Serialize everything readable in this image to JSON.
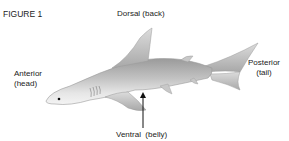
{
  "figure": {
    "title": "FIGURE 1",
    "labels": {
      "dorsal": "Dorsal (back)",
      "anterior_line1": "Anterior",
      "anterior_line2": "(head)",
      "posterior_line1": "Posterior",
      "posterior_line2": "(tail)",
      "ventral": "Ventral",
      "ventral_paren": "(belly)"
    },
    "arrow": "ventral-arrow-up"
  },
  "colors": {
    "text": "#222222",
    "shark_light": "#e8e8e8",
    "shark_mid": "#b8b8b8",
    "shark_dark": "#8a8a8a",
    "arrow": "#111111"
  }
}
